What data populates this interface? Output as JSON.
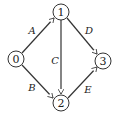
{
  "diagram": {
    "type": "directed-graph",
    "nodes": [
      {
        "id": "0",
        "label": "0",
        "x": 16,
        "y": 59
      },
      {
        "id": "1",
        "label": "1",
        "x": 61,
        "y": 12
      },
      {
        "id": "2",
        "label": "2",
        "x": 61,
        "y": 103
      },
      {
        "id": "3",
        "label": "3",
        "x": 103,
        "y": 61
      }
    ],
    "edges": [
      {
        "label": "A",
        "from": "0",
        "to": "1"
      },
      {
        "label": "B",
        "from": "0",
        "to": "2"
      },
      {
        "label": "C",
        "from": "1",
        "to": "2"
      },
      {
        "label": "D",
        "from": "1",
        "to": "3"
      },
      {
        "label": "E",
        "from": "2",
        "to": "3"
      }
    ]
  }
}
